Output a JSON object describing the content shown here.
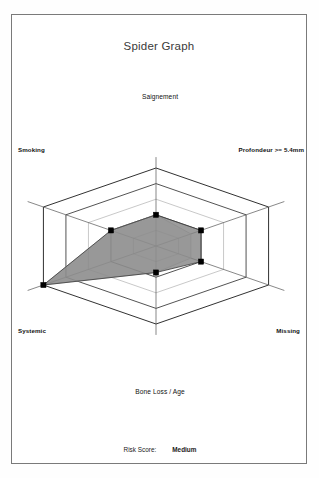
{
  "card": {
    "title": "Spider Graph"
  },
  "footer": {
    "risk_label": "Risk Score:",
    "risk_value": "Medium"
  },
  "colors": {
    "border": "#7a7a7a",
    "grid_outer": "#1a1a1a",
    "grid_inner": "#9a9a9a",
    "axis_line": "#555555",
    "series_fill": "#808080",
    "series_fill_secondary": "#d8d8d8",
    "series_stroke": "#3a3a3a",
    "marker": "#000000",
    "title_text": "#3a3a3a",
    "label_text": "#111111"
  },
  "chart_data": {
    "type": "radar",
    "title": "Spider Graph",
    "xlabel": "",
    "ylabel": "",
    "rings": 5,
    "rlim": [
      0,
      5
    ],
    "grid": true,
    "legend": "none",
    "categories": [
      "Saignement",
      "Profondeur >= 5.4mm",
      "Missing",
      "Bone Loss / Age",
      "Systemic",
      "Smoking"
    ],
    "angles_deg": [
      90,
      30,
      330,
      270,
      210,
      150
    ],
    "series": [
      {
        "name": "Patient",
        "values": [
          2,
          2,
          2,
          1.7,
          5,
          2
        ],
        "fill": "#808080",
        "stroke": "#3a3a3a",
        "marker": "square"
      },
      {
        "name": "Reference",
        "values": [
          2,
          1.55,
          1.55,
          1.7,
          5,
          2
        ],
        "fill": "#d8d8d8",
        "stroke": "#bdbdbd",
        "marker": "none"
      }
    ],
    "annotations": [
      {
        "text": "Risk Score:",
        "value": "Medium"
      }
    ]
  }
}
